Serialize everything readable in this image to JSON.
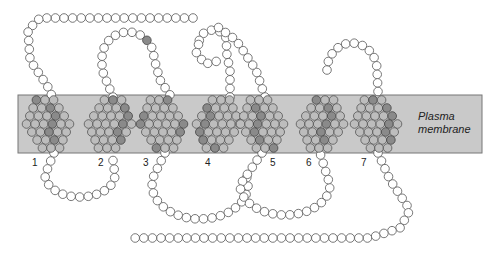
{
  "diagram": {
    "title": "",
    "membrane": {
      "label_line1": "Plasma",
      "label_line2": "membrane",
      "fill": "#c9c9c9",
      "stroke": "#777777",
      "x": 18,
      "y": 95,
      "width": 464,
      "height": 58
    },
    "residue": {
      "radius": 4.3,
      "empty_fill": "#ffffff",
      "empty_stroke": "#555555",
      "highlight_fill": "#8a8a8a",
      "highlight_stroke": "#444444"
    },
    "transmembrane_domains": [
      {
        "number": "1",
        "label_x": 32,
        "label_y": 157,
        "center_x": 48,
        "highlighted": [
          "S",
          "A",
          "E"
        ]
      },
      {
        "number": "2",
        "label_x": 98,
        "label_y": 157,
        "center_x": 110,
        "highlighted": [
          "V",
          "C",
          "T",
          "L",
          "E",
          "Y"
        ]
      },
      {
        "number": "3",
        "label_x": 143,
        "label_y": 157,
        "center_x": 162,
        "highlighted": [
          "L",
          "F",
          "C",
          "E",
          "L",
          "A",
          "E"
        ]
      },
      {
        "number": "4",
        "label_x": 205,
        "label_y": 157,
        "center_x": 218,
        "highlighted": [
          "C",
          "L",
          "S"
        ]
      },
      {
        "number": "5",
        "label_x": 270,
        "label_y": 157,
        "center_x": 262,
        "highlighted": [
          "L",
          "A",
          "C",
          "N"
        ]
      },
      {
        "number": "6",
        "label_x": 306,
        "label_y": 157,
        "center_x": 322,
        "highlighted": [
          "L",
          "C",
          "L"
        ]
      },
      {
        "number": "7",
        "label_x": 361,
        "label_y": 157,
        "center_x": 376,
        "highlighted": [
          "H",
          "A",
          "N",
          "D",
          "I",
          "W",
          "L",
          "V",
          "L"
        ]
      }
    ],
    "extracellular_marks": [
      "L",
      "F",
      "I",
      "N",
      "S",
      "P",
      "Y",
      "R",
      "C",
      "C"
    ],
    "intracellular_marks": [
      "R",
      "E",
      "E",
      "P",
      "R",
      "Q",
      "N",
      "K"
    ],
    "segments": {
      "n_terminus": "top-left horizontal chain",
      "c_terminus": "bottom horizontal chain"
    }
  }
}
